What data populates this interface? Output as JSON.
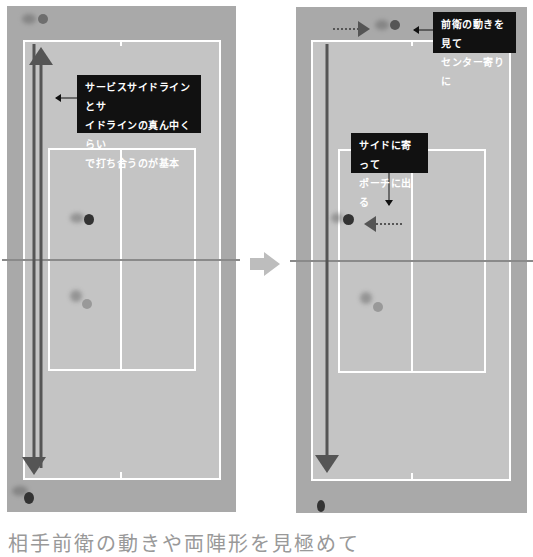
{
  "left_panel": {
    "callout": [
      "サービスサイドラインとサ",
      "イドラインの真ん中くらい",
      "で打ち合うのが基本"
    ]
  },
  "right_panel": {
    "callout_top": [
      "前衛の動きを見て",
      "センター寄りに"
    ],
    "callout_mid": [
      "サイドに寄って",
      "ポーチに出る"
    ]
  },
  "transition_arrow": "right-arrow",
  "caption": "相手前衛の動きや両陣形を見極めて",
  "colors": {
    "court_outer": "#a9a9a9",
    "court_inner": "#c4c4c4",
    "lines": "#ffffff",
    "arrows": "#555555",
    "callout_bg": "#111111"
  }
}
